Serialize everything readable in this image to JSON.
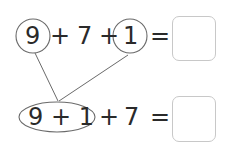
{
  "row1": {
    "n1": "9",
    "op1": "+",
    "n2": "7",
    "op2": "+",
    "n3": "1",
    "eq": "="
  },
  "row2": {
    "group": "9 + 1",
    "op": "+",
    "n": "7",
    "eq": "="
  },
  "colors": {
    "stroke": "#6a6a6a",
    "text": "#2a2a2a",
    "box": "#c8c8c8"
  }
}
